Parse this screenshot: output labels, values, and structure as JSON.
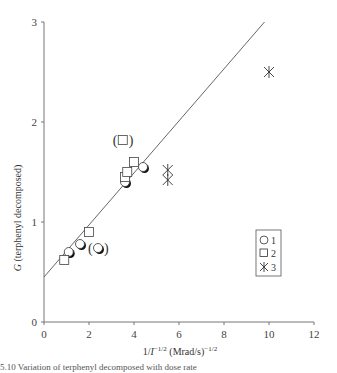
{
  "chart_data": {
    "type": "scatter",
    "title": "",
    "xlabel": "1/I^{-1/2} (Mrad/s)^{-1/2}",
    "xlabel_parts": {
      "prefix": "1/",
      "var": "I",
      "exp1": "−1/2",
      "unit": " (Mrad/s)",
      "exp2": "−1/2"
    },
    "ylabel": "G (terphenyl decomposed)",
    "ylabel_parts": {
      "var": "G",
      "rest": " (terphenyl decomposed)"
    },
    "xlim": [
      0,
      12
    ],
    "ylim": [
      0,
      3
    ],
    "x_ticks": [
      "0",
      "2",
      "4",
      "6",
      "8",
      "10",
      "12"
    ],
    "y_ticks": [
      "0",
      "1",
      "2",
      "3"
    ],
    "grid": false,
    "legend_position": "lower right inside",
    "series": [
      {
        "name": "1",
        "marker": "half-filled circle",
        "points": [
          [
            1.1,
            0.7
          ],
          [
            1.6,
            0.78
          ],
          [
            3.6,
            1.4
          ],
          [
            4.4,
            1.55
          ]
        ],
        "bracketed_points": [
          [
            2.4,
            0.74
          ]
        ]
      },
      {
        "name": "2",
        "marker": "open square",
        "points": [
          [
            0.9,
            0.62
          ],
          [
            2.0,
            0.9
          ],
          [
            3.6,
            1.45
          ],
          [
            3.7,
            1.5
          ],
          [
            4.0,
            1.6
          ]
        ],
        "bracketed_points": [
          [
            3.5,
            1.82
          ]
        ]
      },
      {
        "name": "3",
        "marker": "asterisk",
        "points": [
          [
            5.5,
            1.42
          ],
          [
            5.5,
            1.52
          ],
          [
            10.0,
            2.5
          ]
        ]
      }
    ],
    "fit_line": {
      "x": [
        0,
        9.8
      ],
      "y": [
        0.45,
        3.0
      ]
    }
  },
  "legend": {
    "items": [
      {
        "label": "1"
      },
      {
        "label": "2"
      },
      {
        "label": "3"
      }
    ]
  },
  "caption": "5.10  Variation of terphenyl decomposed with dose rate"
}
